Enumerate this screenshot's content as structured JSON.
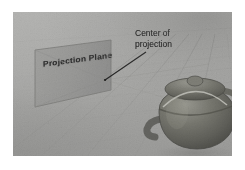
{
  "figure": {
    "kind": "perspective-projection-diagram",
    "medium": "grayscale scanned textbook figure",
    "canvas": {
      "width": 245,
      "height": 170
    },
    "image_area": {
      "left": 13,
      "top": 12,
      "width": 219,
      "height": 144
    },
    "page_background_color": "#ffffff",
    "scene_background_color": "#aeaeac"
  },
  "labels": {
    "projection_plane": "Projection Plane",
    "center_of_projection_line1": "Center of",
    "center_of_projection_line2": "projection"
  },
  "elements": {
    "projection_plane": {
      "name": "projection-plane",
      "shape": "parallelogram",
      "fill_color": "#9b9b99",
      "stroke_color": "#7e7e7c",
      "points": "22,38 98,28 98,78 22,95"
    },
    "center_of_projection_point": {
      "name": "center-of-projection-point",
      "x": 92,
      "y": 68
    },
    "leader_line": {
      "name": "leader-line",
      "from_x": 133,
      "from_y": 40,
      "to_x": 92,
      "to_y": 68,
      "stroke_color": "#2a2a2a"
    },
    "ground_plane": {
      "name": "ground-plane",
      "grid_color": "#8e8e8c",
      "horizon_y": 26
    },
    "teapot": {
      "name": "teapot-object",
      "body_color": "#6f6f6d",
      "shadow_color": "#8b8b89",
      "highlight_color": "#9a9a98",
      "center_x": 180,
      "center_y": 108
    }
  },
  "colors": {
    "ink": "#161616",
    "plane_fill": "#9b9b99",
    "ground_light": "#b5b5b3",
    "ground_dark": "#9b9b99",
    "teapot_dark": "#5a5a58",
    "teapot_mid": "#767674",
    "teapot_light": "#949492"
  }
}
